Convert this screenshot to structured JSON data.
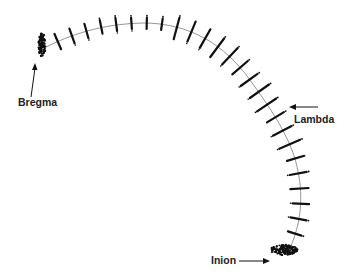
{
  "diagram": {
    "type": "landmark-arc",
    "colors": {
      "curve": "#8a8a8a",
      "marks": "#111111",
      "text": "#222222",
      "background": "#ffffff"
    },
    "labels": {
      "bregma": "Bregma",
      "lambda": "Lambda",
      "inion": "Inion"
    },
    "landmarks": [
      {
        "name": "Bregma",
        "x": 42,
        "y": 45
      },
      {
        "name": "Lambda",
        "x": 277,
        "y": 109
      },
      {
        "name": "Inion",
        "x": 290,
        "y": 248
      }
    ],
    "semilandmark_count": 26
  }
}
